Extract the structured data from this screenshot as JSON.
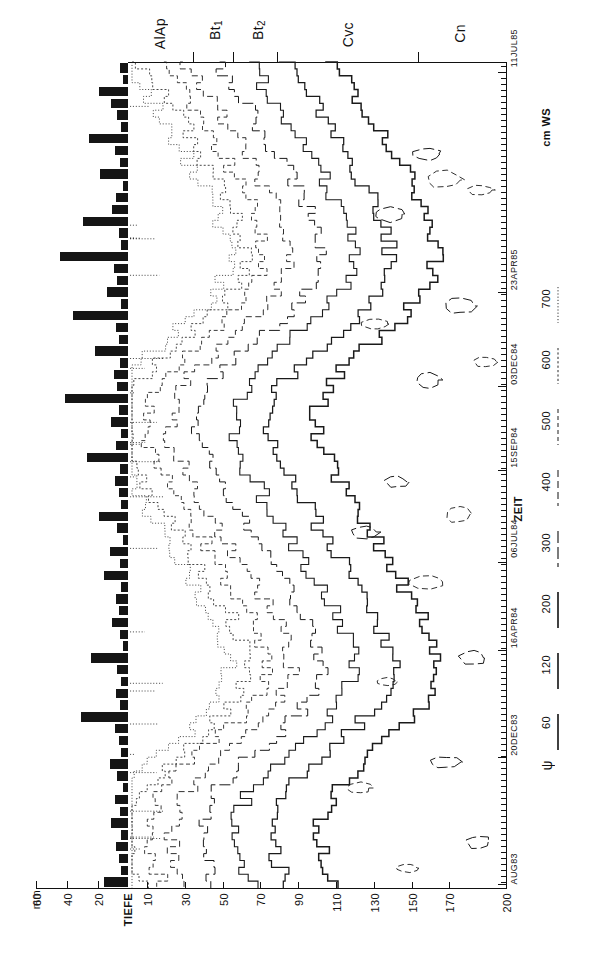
{
  "figure": {
    "kind": "soil-water-tension-isopleth",
    "language": "de"
  },
  "axes": {
    "depth": {
      "label": "TIEFE",
      "unit_implied": "cm",
      "ticks": [
        10,
        30,
        50,
        70,
        90,
        110,
        130,
        150,
        170,
        200
      ],
      "range": [
        0,
        200
      ]
    },
    "precip": {
      "label": "mm",
      "ticks": [
        20,
        40,
        60
      ],
      "range": [
        0,
        70
      ]
    },
    "time": {
      "label": "ZEIT",
      "ticks": [
        "AUG83",
        "20DEC83",
        "16APR84",
        "06JUL84",
        "15SEP84",
        "03DEC84",
        "23APR85",
        "11JUL85"
      ],
      "start": "AUG83",
      "end": "11JUL85"
    }
  },
  "horizons": [
    {
      "name": "AlAp"
    },
    {
      "name": "Bt",
      "sub": "1"
    },
    {
      "name": "Bt",
      "sub": "2"
    },
    {
      "name": "Cvc"
    },
    {
      "name": "Cn"
    }
  ],
  "legend": {
    "symbol": "ψ",
    "unit": "cm WS",
    "entries": [
      {
        "value": "60",
        "style": "solid"
      },
      {
        "value": "120",
        "style": "solid"
      },
      {
        "value": "200",
        "style": "solid"
      },
      {
        "value": "300",
        "style": "long-dash"
      },
      {
        "value": "400",
        "style": "dash"
      },
      {
        "value": "500",
        "style": "short-dash"
      },
      {
        "value": "600",
        "style": "dotted"
      },
      {
        "value": "700",
        "style": "fine-dotted"
      }
    ]
  },
  "chart_data": {
    "type": "line",
    "title": "",
    "xlabel": "ZEIT",
    "ylabel": "TIEFE",
    "grid": false,
    "legend_position": "right",
    "contour_levels": [
      60,
      120,
      200,
      300,
      400,
      500,
      600,
      700
    ],
    "contour_unit": "cm WS",
    "xlim": [
      0,
      200
    ],
    "ylim": [
      0,
      200
    ],
    "depth_tick_labels": [
      "10",
      "30",
      "50",
      "70",
      "90",
      "110",
      "130",
      "150",
      "170",
      "200"
    ],
    "time_tick_labels": [
      "AUG83",
      "20DEC83",
      "16APR84",
      "06JUL84",
      "15SEP84",
      "03DEC84",
      "23APR85",
      "11JUL85"
    ],
    "precip_tick_labels": [
      "20",
      "40",
      "60"
    ],
    "series": [
      {
        "name": "precipitation_mm",
        "values": [
          6,
          4,
          22,
          13,
          8,
          5,
          30,
          10,
          6,
          21,
          4,
          9,
          12,
          34,
          7,
          5,
          52,
          11,
          8,
          16,
          5,
          42,
          9,
          7,
          25,
          6,
          11,
          8,
          48,
          7,
          13,
          5,
          9,
          31,
          6,
          10,
          7,
          5,
          22,
          8,
          4,
          14,
          6,
          18,
          5,
          9,
          7,
          12,
          6,
          4,
          28,
          8,
          5,
          9,
          6,
          36,
          10,
          7,
          5,
          14,
          8,
          4,
          10,
          6,
          13,
          5,
          9,
          7,
          5,
          18
        ]
      }
    ]
  }
}
